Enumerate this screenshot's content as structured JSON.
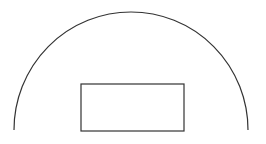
{
  "diagram": {
    "background": "#ffffff",
    "stroke_color": "#333333",
    "arc": {
      "shape": "semicircle",
      "start": [
        14,
        130
      ],
      "end": [
        248,
        130
      ],
      "radius_x": 117,
      "radius_y": 118,
      "stroke_width": 1.2
    },
    "rectangle": {
      "x": 81,
      "y": 84,
      "width": 103,
      "height": 47,
      "stroke_width": 1.2,
      "fill": "none"
    }
  }
}
